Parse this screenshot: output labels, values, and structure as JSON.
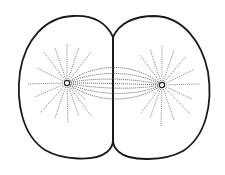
{
  "figure": {
    "title": "Cell division: two daughter cells with asters and spindle fibers",
    "colors": {
      "background": "#ffffff",
      "outline": "#1a1a1a",
      "fibers": "#6e6e6e",
      "spindle": "#555555"
    },
    "cells": [
      {
        "name": "left-daughter-cell"
      },
      {
        "name": "right-daughter-cell"
      }
    ],
    "centrosomes": [
      {
        "name": "left-centrosome",
        "cx": 67,
        "cy": 83
      },
      {
        "name": "right-centrosome",
        "cx": 162,
        "cy": 85
      }
    ],
    "cleavage_furrow": {
      "top": [
        113,
        37
      ],
      "bottom": [
        113,
        140
      ]
    }
  }
}
